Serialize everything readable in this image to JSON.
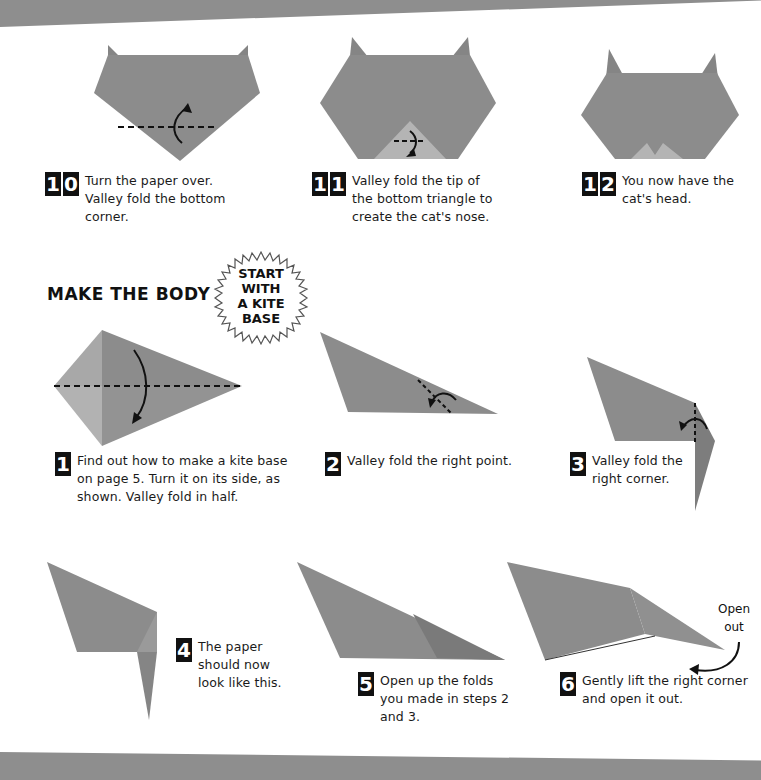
{
  "page": {
    "colors": {
      "paper": "#8e8e8e",
      "paper_dark": "#7a7a7a",
      "paper_light": "#b5b5b5",
      "band": "#8e8e8e",
      "ink": "#111111"
    }
  },
  "head_steps": [
    {
      "number_digits": [
        "1",
        "0"
      ],
      "text": "Turn the paper over. Valley fold the bottom corner."
    },
    {
      "number_digits": [
        "1",
        "1"
      ],
      "text": "Valley fold the tip of the bottom triangle to create the cat's nose."
    },
    {
      "number_digits": [
        "1",
        "2"
      ],
      "text": "You now have the cat's head."
    }
  ],
  "body_section": {
    "title": "MAKE THE BODY",
    "burst_lines": [
      "START",
      "WITH",
      "A KITE",
      "BASE"
    ]
  },
  "body_steps": [
    {
      "number_digits": [
        "1"
      ],
      "text": "Find out how to make a kite base on page 5. Turn it on its side, as shown. Valley fold in half."
    },
    {
      "number_digits": [
        "2"
      ],
      "text": "Valley fold the right point."
    },
    {
      "number_digits": [
        "3"
      ],
      "text": "Valley fold the right corner."
    },
    {
      "number_digits": [
        "4"
      ],
      "text": "The paper should now look like this."
    },
    {
      "number_digits": [
        "5"
      ],
      "text": "Open up the folds you made in steps 2 and 3."
    },
    {
      "number_digits": [
        "6"
      ],
      "text": "Gently lift the right corner and open it out."
    }
  ],
  "annotations": {
    "open_out_line1": "Open",
    "open_out_line2": "out"
  }
}
